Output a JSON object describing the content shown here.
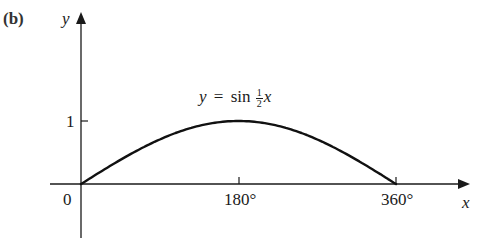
{
  "panel_label": "(b)",
  "axes": {
    "x_label": "x",
    "y_label": "y",
    "origin_label": "0",
    "x_ticks": [
      "180°",
      "360°"
    ],
    "y_ticks": [
      "1"
    ]
  },
  "equation": {
    "lhs": "y",
    "eq": "=",
    "func": "sin",
    "frac_num": "1",
    "frac_den": "2",
    "var": "x"
  },
  "colors": {
    "axis": "#1a1a1a",
    "curve": "#111111",
    "background": "#ffffff"
  },
  "chart_data": {
    "type": "line",
    "xlabel": "x",
    "ylabel": "y",
    "x_tick_labels": [
      "0",
      "180°",
      "360°"
    ],
    "y_tick_labels": [
      "1"
    ],
    "xlim": [
      0,
      360
    ],
    "ylim": [
      0,
      1
    ],
    "grid": false,
    "legend": "none",
    "series": [
      {
        "name": "y = sin ½x",
        "x": [
          0,
          30,
          60,
          90,
          120,
          150,
          180,
          210,
          240,
          270,
          300,
          330,
          360
        ],
        "y": [
          0,
          0.259,
          0.5,
          0.707,
          0.866,
          0.966,
          1,
          0.966,
          0.866,
          0.707,
          0.5,
          0.259,
          0
        ]
      }
    ]
  }
}
